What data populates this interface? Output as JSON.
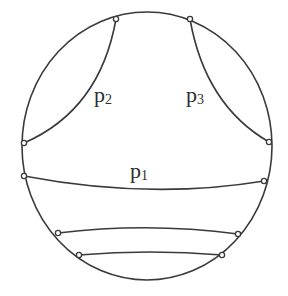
{
  "diagram": {
    "type": "hyperbolic-disk-chords",
    "disk": {
      "cx": 147,
      "cy": 146,
      "rx": 125,
      "ry": 134
    },
    "colors": {
      "stroke": "#3a3a3a",
      "background": "#ffffff"
    },
    "curves": [
      {
        "id": "p2",
        "label_base": "p",
        "label_sub": "2",
        "from": [
          116,
          19
        ],
        "to": [
          24,
          143
        ],
        "control": [
          100,
          110
        ]
      },
      {
        "id": "p3",
        "label_base": "p",
        "label_sub": "3",
        "from": [
          190,
          19
        ],
        "to": [
          269,
          142
        ],
        "control": [
          205,
          105
        ]
      },
      {
        "id": "p1",
        "label_base": "p",
        "label_sub": "1",
        "from": [
          24,
          176
        ],
        "to": [
          264,
          181
        ],
        "control": [
          150,
          200
        ]
      },
      {
        "id": "chord4",
        "from": [
          58,
          233
        ],
        "to": [
          238,
          234
        ],
        "control": [
          148,
          222
        ]
      },
      {
        "id": "chord5",
        "from": [
          79,
          255
        ],
        "to": [
          222,
          255
        ],
        "control": [
          150,
          249
        ]
      }
    ]
  },
  "labels": {
    "p1": {
      "base": "p",
      "sub": "1"
    },
    "p2": {
      "base": "p",
      "sub": "2"
    },
    "p3": {
      "base": "p",
      "sub": "3"
    }
  }
}
